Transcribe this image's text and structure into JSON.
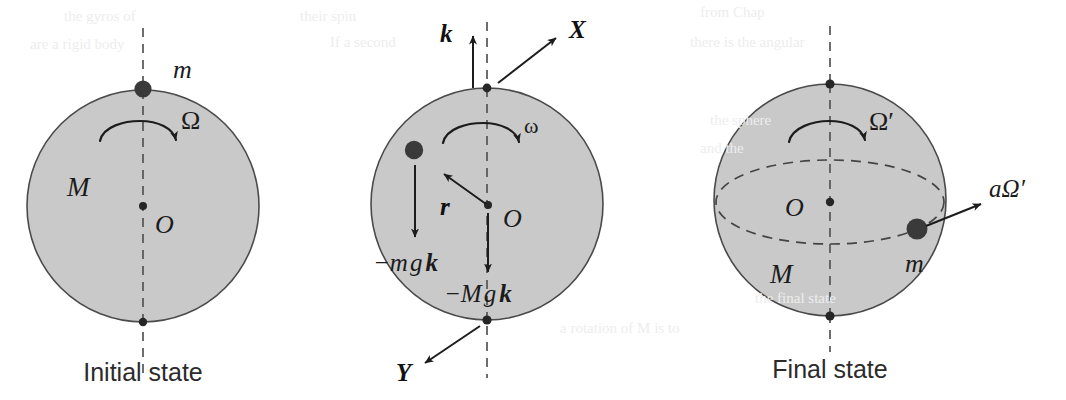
{
  "figure": {
    "background_color": "#ffffff",
    "sphere_fill_color": "#c9c9c9",
    "sphere_stroke_color": "#4a4a4a",
    "ink_color": "#1c1c1c",
    "caption_color": "#2b2b2b",
    "ghost_color": "#ededed"
  },
  "panels": [
    {
      "id": "initial",
      "caption": "Initial state",
      "body_label": "M",
      "mass_label": "m",
      "spin_label": "Ω",
      "center_label": "O",
      "has_equator": false,
      "geometry": {
        "cx": 143,
        "cy": 206,
        "r": 116
      }
    },
    {
      "id": "forces",
      "caption": "",
      "body_label": "",
      "mass_label": "",
      "spin_label": "ω",
      "center_label": "O",
      "has_equator": false,
      "geometry": {
        "cx": 487,
        "cy": 204,
        "r": 116
      },
      "vectors": [
        {
          "name": "k-unit-vector",
          "label": "k",
          "style": "bold-italic"
        },
        {
          "name": "X-axis-vector",
          "label": "X",
          "style": "bold-italic"
        },
        {
          "name": "Y-axis-vector",
          "label": "Y",
          "style": "bold-italic"
        },
        {
          "name": "position-vector",
          "label": "r",
          "style": "bold-italic"
        }
      ],
      "force_labels": [
        {
          "name": "point-mass-weight",
          "prefix": "−m",
          "g": "g",
          "vec": "k"
        },
        {
          "name": "sphere-weight",
          "prefix": "−M",
          "g": "g",
          "vec": "k"
        }
      ]
    },
    {
      "id": "final",
      "caption": "Final state",
      "body_label": "M",
      "mass_label": "m",
      "spin_label": "Ω′",
      "center_label": "O",
      "has_equator": true,
      "velocity_label": "aΩ′",
      "geometry": {
        "cx": 830,
        "cy": 200,
        "r": 116
      }
    }
  ],
  "ghost_text": [
    {
      "text": "the  gyros  of",
      "x": 64,
      "y": 18
    },
    {
      "text": "their spin",
      "x": 300,
      "y": 18
    },
    {
      "text": "from   Chap",
      "x": 700,
      "y": 14
    },
    {
      "text": "are  a  rigid  body",
      "x": 30,
      "y": 46
    },
    {
      "text": "If  a  second",
      "x": 330,
      "y": 44
    },
    {
      "text": "there is the  angular",
      "x": 690,
      "y": 44
    },
    {
      "text": "the  sphere",
      "x": 710,
      "y": 122
    },
    {
      "text": "and  the",
      "x": 700,
      "y": 150
    },
    {
      "text": "a  rotation  of  M  is  to",
      "x": 560,
      "y": 330
    },
    {
      "text": "the  final  state",
      "x": 755,
      "y": 300
    }
  ]
}
